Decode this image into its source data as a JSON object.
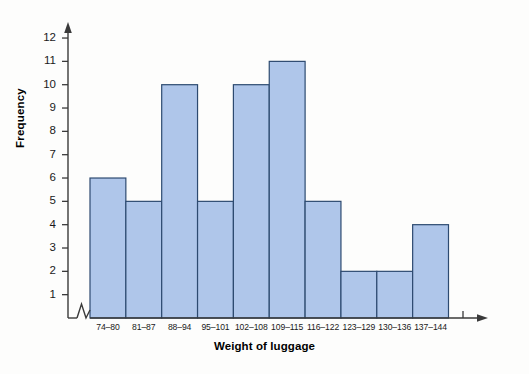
{
  "chart_data": {
    "type": "bar",
    "title": "",
    "subtitle": "",
    "xlabel": "Weight of luggage",
    "ylabel": "Frequency",
    "categories": [
      "74–80",
      "81–87",
      "88–94",
      "95–101",
      "102–108",
      "109–115",
      "116–122",
      "123–129",
      "130–136",
      "137–144"
    ],
    "values": [
      6,
      5,
      10,
      5,
      10,
      11,
      5,
      2,
      2,
      4
    ],
    "ylim": [
      0,
      12
    ],
    "ytick_labels": [
      "1",
      "2",
      "3",
      "4",
      "5",
      "6",
      "7",
      "8",
      "9",
      "10",
      "11",
      "12"
    ],
    "ytick_values": [
      1,
      2,
      3,
      4,
      5,
      6,
      7,
      8,
      9,
      10,
      11,
      12
    ],
    "grid": false,
    "legend": null,
    "axis_break": "x-axis origin break (zigzag)",
    "bar_fill_color": "#afc6ea",
    "bar_border_color": "#2d4a70",
    "axis_color": "#3a3a3a",
    "background_color": "#fdfdfc",
    "text_color": "#1a1a1a"
  },
  "axes": {
    "x_title": "Weight of luggage",
    "y_title": "Frequency"
  },
  "icons": {
    "y_arrow": "arrow-up-icon",
    "x_arrow": "arrow-right-icon",
    "break": "axis-break-icon"
  }
}
